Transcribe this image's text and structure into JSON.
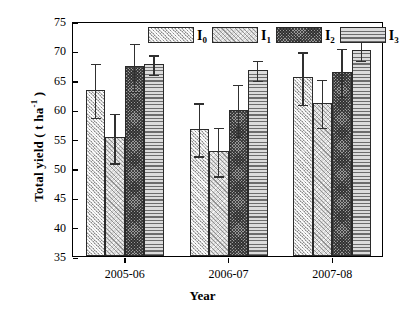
{
  "chart_data": {
    "type": "bar",
    "title": "",
    "xlabel": "Year",
    "ylabel": "Total yield ( t ha",
    "ylabel_sup": "-1",
    "ylabel_tail": " )",
    "categories": [
      "2005-06",
      "2006-07",
      "2007-08"
    ],
    "ylim": [
      35,
      75
    ],
    "yticks": [
      35,
      40,
      45,
      50,
      55,
      60,
      65,
      70,
      75
    ],
    "ytick_labels": [
      "35",
      "40",
      "45",
      "50",
      "55",
      "60",
      "65",
      "70",
      "75"
    ],
    "grid": false,
    "legend_position": "top-center",
    "error_bars": "symmetric",
    "series": [
      {
        "name": "I0",
        "label": "I",
        "sub": "0",
        "pattern": "diagonal-hatch-light",
        "color": "#c9c9c9",
        "values": [
          63.3,
          56.7,
          65.4
        ],
        "errors": [
          4.7,
          4.6,
          4.6
        ]
      },
      {
        "name": "I1",
        "label": "I",
        "sub": "1",
        "pattern": "diagonal-crosshatch-fine",
        "color": "#d8d8d8",
        "values": [
          55.2,
          52.9,
          61.1
        ],
        "errors": [
          4.3,
          4.2,
          4.2
        ]
      },
      {
        "name": "I2",
        "label": "I",
        "sub": "2",
        "pattern": "dense-crosshatch-dark",
        "color": "#9a9a9a",
        "values": [
          67.3,
          59.9,
          66.4
        ],
        "errors": [
          4.2,
          4.5,
          4.2
        ]
      },
      {
        "name": "I3",
        "label": "I",
        "sub": "3",
        "pattern": "horizontal-lines",
        "color": "#dcdcdc",
        "values": [
          67.7,
          66.7,
          70.1
        ],
        "errors": [
          1.8,
          1.8,
          1.7
        ]
      }
    ]
  }
}
